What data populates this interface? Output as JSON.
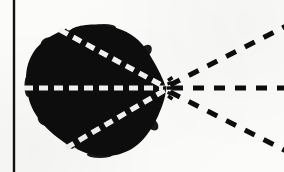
{
  "figure": {
    "caption": "",
    "background_color": "#fbfbfa",
    "ink_color": "#0d0d0d",
    "dash_light_color": "#f4f3f1",
    "width": 284,
    "height": 172
  },
  "border_rule": {
    "name": "left vertical rule",
    "orientation": "vertical",
    "x": 14,
    "y_start": 0,
    "y_end": 172,
    "thickness": 2.4,
    "color": "#101010"
  },
  "blob": {
    "name": "irregular filled body",
    "fill_color": "#0d0d0d",
    "bounds": {
      "left": 26,
      "top": 25,
      "right": 168,
      "bottom": 157
    },
    "apex": {
      "x": 166,
      "y": 88
    },
    "notch_top": {
      "x": 68,
      "y": 29
    },
    "notch_bottom": {
      "x": 70,
      "y": 148
    },
    "outline_path": "M 166 88 C 163 80 158 70 152 60 C 146 48 138 38 126 32 C 114 26 100 24 88 25 C 80 25.5 74 27 70.5 29.5 C 68.5 31 67 30.5 65.5 28.5 C 63.5 30.5 60 31.5 55 34 C 46 38.5 38 45 33 53 C 27.5 62 25.5 72 26.2 83 C 26.9 95 30 106 36 115 C 42.5 125 51 133 61 140 C 64.5 142.5 67 144.5 68.8 146.5 C 70.8 148.8 72.4 149.2 74.2 147.2 C 78.5 150 84 152.5 90.5 154 C 100 156.2 110 156.6 119 154.3 C 130 151.4 139 145 146 136 C 153.5 126.5 159 115 163 103 C 164.8 97.5 165.8 92.5 166 88 Z"
  },
  "inner_rays": {
    "name": "white dashed rays inside body",
    "color": "#f4f3f1",
    "stroke_width": 5.2,
    "dash_pattern": "9 6",
    "rays": [
      {
        "id": "inner-ray-upper",
        "from": {
          "x": 62,
          "y": 31
        },
        "to": {
          "x": 164,
          "y": 87
        },
        "direction": "upper-left"
      },
      {
        "id": "inner-ray-middle",
        "from": {
          "x": 26,
          "y": 88
        },
        "to": {
          "x": 164,
          "y": 88
        },
        "direction": "left-horizontal"
      },
      {
        "id": "inner-ray-lower",
        "from": {
          "x": 68,
          "y": 147
        },
        "to": {
          "x": 164,
          "y": 90
        },
        "direction": "lower-left"
      }
    ]
  },
  "outer_rays": {
    "name": "black dashed rays outside body",
    "color": "#0d0d0d",
    "stroke_width": 5.0,
    "dash_pattern": "11 10",
    "rays": [
      {
        "id": "outer-ray-upper",
        "from": {
          "x": 170,
          "y": 85
        },
        "to": {
          "x": 284,
          "y": 27
        },
        "direction": "upper-right"
      },
      {
        "id": "outer-ray-middle",
        "from": {
          "x": 172,
          "y": 88
        },
        "to": {
          "x": 284,
          "y": 88
        },
        "direction": "right-horizontal"
      },
      {
        "id": "outer-ray-lower",
        "from": {
          "x": 170,
          "y": 92
        },
        "to": {
          "x": 284,
          "y": 150
        },
        "direction": "lower-right"
      }
    ]
  },
  "apex_burst": {
    "name": "convergence burst at apex",
    "center": {
      "x": 167,
      "y": 88
    },
    "tick_color": "#0d0d0d",
    "tick_count": 6
  },
  "labels": {
    "alt_text": "A solid black irregular blob with three white dashed lines converging at its right-hand point, and three black dashed lines continuing outward to the right; a vertical black rule runs down the left edge."
  }
}
